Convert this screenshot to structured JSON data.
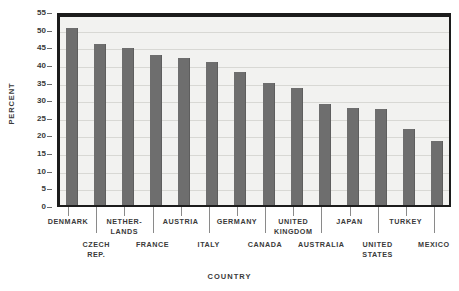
{
  "chart_data": {
    "type": "bar",
    "title": "",
    "xlabel": "Country",
    "ylabel": "Percent",
    "ylim": [
      0,
      55
    ],
    "ytick_step": 5,
    "yticks": [
      0,
      5,
      10,
      15,
      20,
      25,
      30,
      35,
      40,
      45,
      50,
      55
    ],
    "ytick_labels": [
      "0",
      "5",
      "10",
      "15",
      "20",
      "25",
      "30",
      "35",
      "40",
      "45",
      "50",
      "55"
    ],
    "grid": true,
    "grid_axis": "y",
    "legend": false,
    "bar_color": "#6e6e6e",
    "plot_bgcolor": "#f2f2f0",
    "axis_color": "#1c1c1c",
    "gridline_color": "#d8d8d4",
    "categories": [
      "Denmark",
      "Czech Rep.",
      "Netherlands",
      "France",
      "Austria",
      "Italy",
      "Germany",
      "Canada",
      "United Kingdom",
      "Australia",
      "Japan",
      "United States",
      "Turkey",
      "Mexico"
    ],
    "category_label_lines": [
      [
        "Denmark"
      ],
      [
        "Czech",
        "Rep."
      ],
      [
        "Nether-",
        "lands"
      ],
      [
        "France"
      ],
      [
        "Austria"
      ],
      [
        "Italy"
      ],
      [
        "Germany"
      ],
      [
        "Canada"
      ],
      [
        "United",
        "Kingdom"
      ],
      [
        "Australia"
      ],
      [
        "Japan"
      ],
      [
        "United",
        "States"
      ],
      [
        "Turkey"
      ],
      [
        "Mexico"
      ]
    ],
    "label_rows": [
      0,
      1,
      0,
      1,
      0,
      1,
      0,
      1,
      0,
      1,
      0,
      1,
      0,
      1
    ],
    "values": [
      51.5,
      47,
      46,
      44,
      43,
      42,
      39,
      36,
      34.5,
      30,
      29,
      28.5,
      23,
      19.5
    ]
  }
}
